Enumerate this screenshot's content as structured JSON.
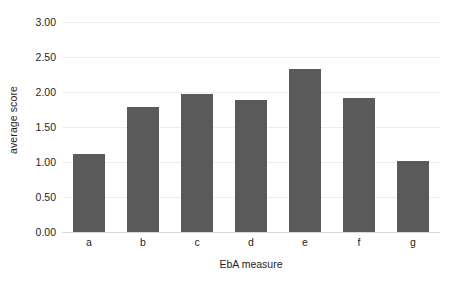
{
  "chart_data": {
    "type": "bar",
    "title": "",
    "subtitle": "",
    "xlabel": "EbA measure",
    "ylabel": "average score",
    "categories": [
      "a",
      "b",
      "c",
      "d",
      "e",
      "f",
      "g"
    ],
    "values": [
      1.12,
      1.79,
      1.97,
      1.88,
      2.33,
      1.92,
      1.02
    ],
    "ylim": [
      0.0,
      3.0
    ],
    "ytick_values": [
      0.0,
      0.5,
      1.0,
      1.5,
      2.0,
      2.5,
      3.0
    ],
    "ytick_labels": [
      "0.00",
      "0.50",
      "1.00",
      "1.50",
      "2.00",
      "2.50",
      "3.00"
    ],
    "grid": true,
    "grid_axis": "y",
    "legend": false,
    "legend_position": "none",
    "bar_color": "#5a5a5a",
    "gridline_color": "#ededed",
    "axis_color": "#d9d9d9",
    "background_color": "#ffffff",
    "text_color": "#1f1f1f"
  }
}
